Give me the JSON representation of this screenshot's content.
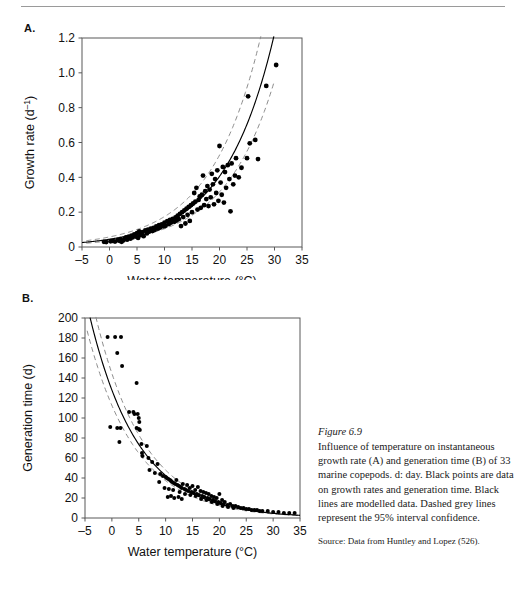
{
  "document": {
    "figure_number": "Figure 6.9",
    "caption": "Influence of temperature on instantaneous growth rate (A) and generation time (B) of 33 marine copepods. d: day. Black points are data on growth rates and generation time. Black lines are modelled data. Dashed grey lines represent the 95% interval confidence.",
    "source": "Source: Data from Huntley and Lopez (526)."
  },
  "panels": {
    "a_letter": "A.",
    "b_letter": "B."
  },
  "style": {
    "point_color": "#000000",
    "model_line_color": "#000000",
    "ci_line_color": "#8c8c8c",
    "axis_color": "#595959",
    "rule_color": "#9a9a9a"
  },
  "chart_data": [
    {
      "id": "panel-a",
      "type": "scatter",
      "title": "",
      "panel_label": "A.",
      "xlabel": "Water temperature (°C)",
      "ylabel": "Growth rate (d⁻¹)",
      "xlim": [
        -5,
        35
      ],
      "ylim": [
        0,
        1.2
      ],
      "xticks": [
        -5,
        0,
        5,
        10,
        15,
        20,
        25,
        30,
        35
      ],
      "xticklabels": [
        "–5",
        "0",
        "5",
        "10",
        "15",
        "20",
        "25",
        "30",
        "35"
      ],
      "yticks": [
        0,
        0.2,
        0.4,
        0.6,
        0.8,
        1.0,
        1.2
      ],
      "yticklabels": [
        "0",
        "0.2",
        "0.4",
        "0.6",
        "0.8",
        "1.0",
        "1.2"
      ],
      "grid": false,
      "legend": null,
      "model": {
        "label": "modelled data",
        "style": "solid",
        "color": "#000000",
        "form": "exponential",
        "a": 0.0445,
        "b": 0.1105,
        "x_start": -5,
        "x_end": 31.2
      },
      "ci_bands": {
        "label": "95% interval confidence",
        "style": "dashed",
        "color": "#8c8c8c",
        "upper_factor": 1.3,
        "lower_factor": 0.78,
        "x_start": -4.2,
        "x_end": 30.0
      },
      "points": [
        [
          -1.0,
          0.03
        ],
        [
          -0.6,
          0.028
        ],
        [
          0.2,
          0.033
        ],
        [
          0.6,
          0.035
        ],
        [
          1.0,
          0.031
        ],
        [
          1.5,
          0.04
        ],
        [
          1.8,
          0.036
        ],
        [
          2.0,
          0.045
        ],
        [
          2.2,
          0.03
        ],
        [
          2.5,
          0.038
        ],
        [
          2.8,
          0.05
        ],
        [
          3.0,
          0.055
        ],
        [
          3.2,
          0.042
        ],
        [
          3.5,
          0.06
        ],
        [
          3.8,
          0.048
        ],
        [
          4.0,
          0.065
        ],
        [
          4.2,
          0.055
        ],
        [
          4.5,
          0.072
        ],
        [
          4.8,
          0.06
        ],
        [
          5.0,
          0.08
        ],
        [
          5.2,
          0.052
        ],
        [
          5.4,
          0.09
        ],
        [
          5.6,
          0.068
        ],
        [
          5.8,
          0.075
        ],
        [
          6.0,
          0.085
        ],
        [
          6.2,
          0.062
        ],
        [
          6.5,
          0.095
        ],
        [
          6.8,
          0.078
        ],
        [
          7.0,
          0.1
        ],
        [
          7.2,
          0.088
        ],
        [
          7.5,
          0.105
        ],
        [
          7.8,
          0.092
        ],
        [
          8.0,
          0.11
        ],
        [
          8.2,
          0.098
        ],
        [
          8.5,
          0.118
        ],
        [
          8.8,
          0.105
        ],
        [
          9.0,
          0.125
        ],
        [
          9.2,
          0.112
        ],
        [
          9.5,
          0.13
        ],
        [
          9.8,
          0.118
        ],
        [
          10.0,
          0.14
        ],
        [
          10.2,
          0.122
        ],
        [
          10.5,
          0.148
        ],
        [
          10.8,
          0.132
        ],
        [
          11.0,
          0.155
        ],
        [
          11.2,
          0.14
        ],
        [
          11.5,
          0.162
        ],
        [
          11.8,
          0.145
        ],
        [
          12.0,
          0.17
        ],
        [
          12.2,
          0.152
        ],
        [
          12.4,
          0.18
        ],
        [
          12.6,
          0.16
        ],
        [
          12.8,
          0.19
        ],
        [
          13.0,
          0.12
        ],
        [
          13.2,
          0.2
        ],
        [
          13.4,
          0.172
        ],
        [
          13.6,
          0.21
        ],
        [
          13.8,
          0.135
        ],
        [
          14.0,
          0.22
        ],
        [
          14.2,
          0.185
        ],
        [
          14.4,
          0.23
        ],
        [
          14.6,
          0.15
        ],
        [
          14.8,
          0.24
        ],
        [
          15.0,
          0.2
        ],
        [
          15.2,
          0.25
        ],
        [
          15.4,
          0.31
        ],
        [
          15.6,
          0.26
        ],
        [
          15.8,
          0.34
        ],
        [
          16.0,
          0.215
        ],
        [
          16.2,
          0.27
        ],
        [
          16.4,
          0.29
        ],
        [
          16.6,
          0.225
        ],
        [
          16.8,
          0.3
        ],
        [
          17.0,
          0.41
        ],
        [
          17.2,
          0.24
        ],
        [
          17.4,
          0.32
        ],
        [
          17.6,
          0.275
        ],
        [
          17.8,
          0.35
        ],
        [
          18.0,
          0.235
        ],
        [
          18.2,
          0.33
        ],
        [
          18.4,
          0.285
        ],
        [
          18.6,
          0.42
        ],
        [
          18.8,
          0.36
        ],
        [
          19.0,
          0.245
        ],
        [
          19.2,
          0.39
        ],
        [
          19.4,
          0.31
        ],
        [
          19.6,
          0.44
        ],
        [
          19.8,
          0.265
        ],
        [
          20.0,
          0.58
        ],
        [
          20.2,
          0.37
        ],
        [
          20.4,
          0.3
        ],
        [
          20.6,
          0.46
        ],
        [
          20.8,
          0.255
        ],
        [
          21.0,
          0.43
        ],
        [
          21.2,
          0.34
        ],
        [
          21.5,
          0.47
        ],
        [
          21.8,
          0.39
        ],
        [
          22.0,
          0.205
        ],
        [
          22.2,
          0.48
        ],
        [
          22.5,
          0.36
        ],
        [
          22.8,
          0.41
        ],
        [
          23.0,
          0.51
        ],
        [
          23.5,
          0.4
        ],
        [
          24.0,
          0.455
        ],
        [
          25.0,
          0.51
        ],
        [
          25.2,
          0.865
        ],
        [
          25.5,
          0.595
        ],
        [
          26.5,
          0.615
        ],
        [
          27.0,
          0.505
        ],
        [
          28.5,
          0.925
        ],
        [
          30.3,
          1.045
        ]
      ]
    },
    {
      "id": "panel-b",
      "type": "scatter",
      "title": "",
      "panel_label": "B.",
      "xlabel": "Water temperature (°C)",
      "ylabel": "Generation time (d)",
      "xlim": [
        -5,
        35
      ],
      "ylim": [
        0,
        200
      ],
      "xticks": [
        -5,
        0,
        5,
        10,
        15,
        20,
        25,
        30,
        35
      ],
      "xticklabels": [
        "–5",
        "0",
        "5",
        "10",
        "15",
        "20",
        "25",
        "30",
        "35"
      ],
      "yticks": [
        0,
        20,
        40,
        60,
        80,
        100,
        120,
        140,
        160,
        180,
        200
      ],
      "yticklabels": [
        "0",
        "20",
        "40",
        "60",
        "80",
        "100",
        "120",
        "140",
        "160",
        "180",
        "200"
      ],
      "grid": false,
      "legend": null,
      "model": {
        "label": "modelled data",
        "style": "solid",
        "color": "#000000",
        "form": "exponential-decay",
        "a": 128.0,
        "b": 0.1105,
        "x_start": -4.6,
        "x_end": 35
      },
      "ci_bands": {
        "label": "95% interval confidence",
        "style": "dashed",
        "color": "#8c8c8c",
        "upper_factor": 1.13,
        "lower_factor": 0.88,
        "x_start": -4.6,
        "x_end": 35
      },
      "points": [
        [
          -0.8,
          181
        ],
        [
          0.6,
          181
        ],
        [
          1.7,
          181
        ],
        [
          1.0,
          165
        ],
        [
          1.9,
          152
        ],
        [
          4.6,
          135
        ],
        [
          3.2,
          106
        ],
        [
          4.0,
          106
        ],
        [
          4.2,
          104
        ],
        [
          4.8,
          104
        ],
        [
          5.0,
          100
        ],
        [
          5.1,
          96
        ],
        [
          -0.3,
          91
        ],
        [
          1.0,
          90
        ],
        [
          1.6,
          90
        ],
        [
          4.6,
          90
        ],
        [
          5.0,
          89
        ],
        [
          5.2,
          88
        ],
        [
          1.4,
          76
        ],
        [
          5.5,
          74
        ],
        [
          6.5,
          72
        ],
        [
          5.6,
          65
        ],
        [
          5.7,
          62
        ],
        [
          6.8,
          60
        ],
        [
          7.5,
          56
        ],
        [
          8.5,
          54
        ],
        [
          7.0,
          48
        ],
        [
          8.0,
          45
        ],
        [
          9.0,
          44
        ],
        [
          9.5,
          42
        ],
        [
          10.0,
          41
        ],
        [
          10.2,
          40
        ],
        [
          10.5,
          39
        ],
        [
          10.8,
          38
        ],
        [
          11.0,
          37
        ],
        [
          11.2,
          36
        ],
        [
          11.5,
          35
        ],
        [
          11.8,
          34
        ],
        [
          12.0,
          38
        ],
        [
          12.2,
          33
        ],
        [
          12.5,
          32
        ],
        [
          12.8,
          31
        ],
        [
          13.0,
          30
        ],
        [
          13.2,
          34
        ],
        [
          13.5,
          29
        ],
        [
          13.8,
          28
        ],
        [
          14.0,
          33
        ],
        [
          14.2,
          27
        ],
        [
          14.5,
          30
        ],
        [
          14.8,
          26
        ],
        [
          15.0,
          32
        ],
        [
          15.2,
          25
        ],
        [
          15.5,
          28
        ],
        [
          15.8,
          24
        ],
        [
          16.0,
          31
        ],
        [
          16.2,
          23
        ],
        [
          16.5,
          27
        ],
        [
          16.8,
          22
        ],
        [
          17.0,
          26
        ],
        [
          17.2,
          21
        ],
        [
          17.5,
          25
        ],
        [
          17.8,
          20
        ],
        [
          18.0,
          24
        ],
        [
          18.2,
          19
        ],
        [
          18.5,
          22
        ],
        [
          18.8,
          18
        ],
        [
          19.0,
          21
        ],
        [
          19.2,
          17
        ],
        [
          19.5,
          20
        ],
        [
          19.8,
          16
        ],
        [
          20.0,
          24
        ],
        [
          20.2,
          15
        ],
        [
          20.5,
          18
        ],
        [
          20.8,
          14
        ],
        [
          21.0,
          16
        ],
        [
          21.5,
          13
        ],
        [
          22.0,
          14
        ],
        [
          22.5,
          12
        ],
        [
          23.0,
          12
        ],
        [
          23.5,
          11
        ],
        [
          24.0,
          10
        ],
        [
          24.5,
          10
        ],
        [
          25.0,
          9
        ],
        [
          25.5,
          9
        ],
        [
          26.0,
          8
        ],
        [
          26.5,
          8
        ],
        [
          27.0,
          8
        ],
        [
          27.5,
          7
        ],
        [
          28.0,
          7
        ],
        [
          29.0,
          7
        ],
        [
          30.0,
          6
        ],
        [
          31.0,
          6
        ],
        [
          32.0,
          5
        ],
        [
          33.0,
          5
        ],
        [
          34.0,
          5
        ],
        [
          10.4,
          21
        ],
        [
          11.0,
          22
        ],
        [
          11.6,
          20
        ],
        [
          12.4,
          21
        ],
        [
          13.0,
          19
        ],
        [
          9.8,
          30
        ],
        [
          10.6,
          29
        ],
        [
          11.4,
          28
        ],
        [
          12.6,
          26
        ],
        [
          13.6,
          24
        ],
        [
          14.6,
          23
        ],
        [
          15.6,
          22
        ],
        [
          16.6,
          19
        ],
        [
          17.6,
          18
        ],
        [
          18.6,
          16
        ],
        [
          19.6,
          14
        ],
        [
          20.6,
          12
        ],
        [
          21.6,
          11
        ],
        [
          22.6,
          10
        ],
        [
          8.8,
          36
        ]
      ]
    }
  ]
}
